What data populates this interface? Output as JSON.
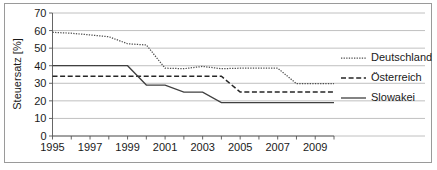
{
  "chart_data": {
    "type": "line",
    "title": "",
    "xlabel": "",
    "ylabel": "Steuersatz [%]",
    "ylim": [
      0,
      70
    ],
    "xlim": [
      1995,
      2010
    ],
    "y_ticks": [
      0,
      10,
      20,
      30,
      40,
      50,
      60,
      70
    ],
    "y_tick_labels": [
      "0",
      "10",
      "20",
      "30",
      "40",
      "50",
      "60",
      "70"
    ],
    "x": [
      1995,
      1996,
      1997,
      1998,
      1999,
      2000,
      2001,
      2002,
      2003,
      2004,
      2005,
      2006,
      2007,
      2008,
      2009,
      2010
    ],
    "x_ticks": [
      1995,
      1996,
      1997,
      1998,
      1999,
      2000,
      2001,
      2002,
      2003,
      2004,
      2005,
      2006,
      2007,
      2008,
      2009,
      2010
    ],
    "x_tick_labels": [
      "1995",
      "",
      "1997",
      "",
      "1999",
      "",
      "2001",
      "",
      "2003",
      "",
      "2005",
      "",
      "2007",
      "",
      "2009",
      ""
    ],
    "x_labeled_ticks": [
      "1995",
      "1997",
      "1999",
      "2001",
      "2003",
      "2005",
      "2007",
      "2009"
    ],
    "grid": true,
    "legend_position": "right",
    "series": [
      {
        "name": "Deutschland",
        "style": "dotted",
        "color": "#4d4d4d",
        "values": [
          59.0,
          58.5,
          57.5,
          56.5,
          52.5,
          51.8,
          38.6,
          38.3,
          39.6,
          38.3,
          38.6,
          38.6,
          38.6,
          29.8,
          29.8,
          29.8
        ]
      },
      {
        "name": "Österreich",
        "style": "dashed",
        "color": "#262626",
        "values": [
          34.0,
          34.0,
          34.0,
          34.0,
          34.0,
          34.0,
          34.0,
          34.0,
          34.0,
          34.0,
          25.0,
          25.0,
          25.0,
          25.0,
          25.0,
          25.0
        ]
      },
      {
        "name": "Slowakei",
        "style": "solid",
        "color": "#404040",
        "values": [
          40.0,
          40.0,
          40.0,
          40.0,
          40.0,
          29.0,
          29.0,
          25.0,
          25.0,
          19.0,
          19.0,
          19.0,
          19.0,
          19.0,
          19.0,
          19.0
        ]
      }
    ]
  },
  "legend": {
    "items": [
      {
        "label": "Deutschland"
      },
      {
        "label": "Österreich"
      },
      {
        "label": "Slowakei"
      }
    ]
  }
}
